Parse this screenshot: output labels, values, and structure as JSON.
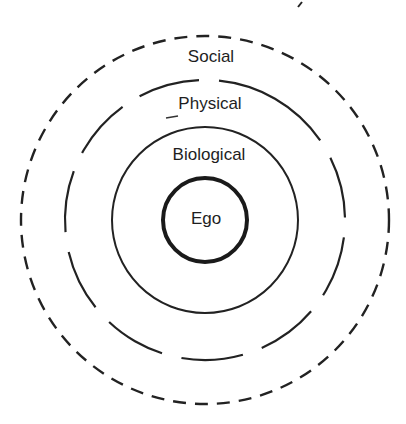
{
  "diagram": {
    "type": "concentric-rings",
    "center": [
      205,
      220
    ],
    "rings": [
      {
        "label": "Ego",
        "radius": 42,
        "style": "solid-thick"
      },
      {
        "label": "Biological",
        "radius": 93,
        "style": "solid"
      },
      {
        "label": "Physical",
        "radius": 140,
        "style": "long-dash"
      },
      {
        "label": "Social",
        "radius": 184,
        "style": "short-dash"
      }
    ],
    "labels": {
      "social": "Social",
      "physical": "Physical",
      "biological": "Biological",
      "ego": "Ego"
    },
    "stroke_color": "#222222"
  }
}
